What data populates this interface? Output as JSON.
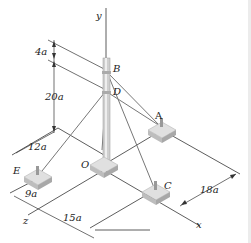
{
  "diagram": {
    "type": "3D statics tower with guy wires",
    "points": [
      {
        "id": "y",
        "label": "y"
      },
      {
        "id": "B",
        "label": "B"
      },
      {
        "id": "D",
        "label": "D"
      },
      {
        "id": "A",
        "label": "A"
      },
      {
        "id": "O",
        "label": "O"
      },
      {
        "id": "E",
        "label": "E"
      },
      {
        "id": "C",
        "label": "C"
      },
      {
        "id": "x",
        "label": "x"
      },
      {
        "id": "z",
        "label": "z"
      }
    ],
    "dimensions": [
      {
        "id": "dim-BD",
        "label": "4a"
      },
      {
        "id": "dim-D-ground",
        "label": "20a"
      },
      {
        "id": "dim-E-offset",
        "label": "12a"
      },
      {
        "id": "dim-E-z",
        "label": "9a"
      },
      {
        "id": "dim-C-x",
        "label": "15a"
      },
      {
        "id": "dim-A-C",
        "label": "18a"
      }
    ],
    "colors": {
      "line": "#333333",
      "cable": "#777777",
      "pole": "#c8c8c8",
      "base": "#d2d2d2"
    }
  }
}
